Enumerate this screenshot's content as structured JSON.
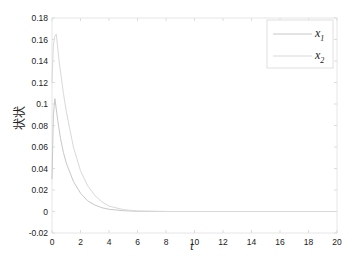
{
  "chart_data": {
    "type": "line",
    "title": "",
    "xlabel": "t",
    "ylabel": "状状",
    "xlim": [
      0,
      20
    ],
    "ylim": [
      -0.02,
      0.18
    ],
    "xticks": [
      0,
      2,
      4,
      6,
      8,
      10,
      12,
      14,
      16,
      18,
      20
    ],
    "yticks": [
      -0.02,
      0,
      0.02,
      0.04,
      0.06,
      0.08,
      0.1,
      0.12,
      0.14,
      0.16,
      0.18
    ],
    "ytick_labels": [
      "-0.02",
      "0",
      "0.02",
      "0.04",
      "0.06",
      "0.08",
      "0.1",
      "0.12",
      "0.14",
      "0.16",
      "0.18"
    ],
    "grid": false,
    "legend_position": "upper right",
    "series": [
      {
        "name": "x1",
        "label_base": "x",
        "label_sub": "1",
        "color": "#c8c8c8",
        "x": [
          0,
          0.1,
          0.2,
          0.4,
          0.6,
          0.8,
          1.0,
          1.5,
          2.0,
          2.5,
          3.0,
          3.5,
          4.0,
          5.0,
          6.0,
          8.0,
          10,
          15,
          20
        ],
        "y": [
          0.03,
          0.09,
          0.105,
          0.085,
          0.068,
          0.055,
          0.045,
          0.028,
          0.017,
          0.01,
          0.006,
          0.0035,
          0.002,
          0.0007,
          0.0002,
          0,
          0,
          0,
          0
        ]
      },
      {
        "name": "x2",
        "label_base": "x",
        "label_sub": "2",
        "color": "#d9d9d9",
        "x": [
          0,
          0.1,
          0.2,
          0.3,
          0.5,
          0.8,
          1.0,
          1.5,
          2.0,
          2.5,
          3.0,
          3.5,
          4.0,
          5.0,
          6.0,
          8.0,
          10,
          15,
          20
        ],
        "y": [
          0.12,
          0.155,
          0.163,
          0.165,
          0.14,
          0.11,
          0.093,
          0.06,
          0.038,
          0.024,
          0.015,
          0.009,
          0.005,
          0.0018,
          0.0005,
          0,
          0,
          0,
          0
        ]
      }
    ]
  }
}
